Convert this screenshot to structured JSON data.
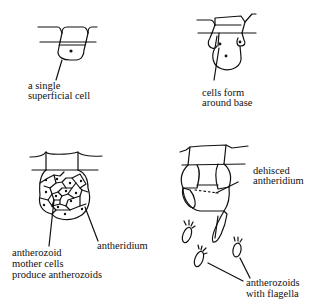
{
  "diagram": {
    "stages": [
      {
        "id": "stage-1",
        "labels": [
          "a single",
          "superficial cell"
        ]
      },
      {
        "id": "stage-2",
        "labels": [
          "cells form",
          "around base"
        ]
      },
      {
        "id": "stage-3",
        "labels": [
          "antherozoid",
          "mother cells",
          "produce antherozoids"
        ],
        "side_label": "antheridium"
      },
      {
        "id": "stage-4",
        "labels": [
          "dehisced",
          "antheridium"
        ],
        "bottom_labels": [
          "antherozoids",
          "with flagella"
        ]
      }
    ]
  }
}
